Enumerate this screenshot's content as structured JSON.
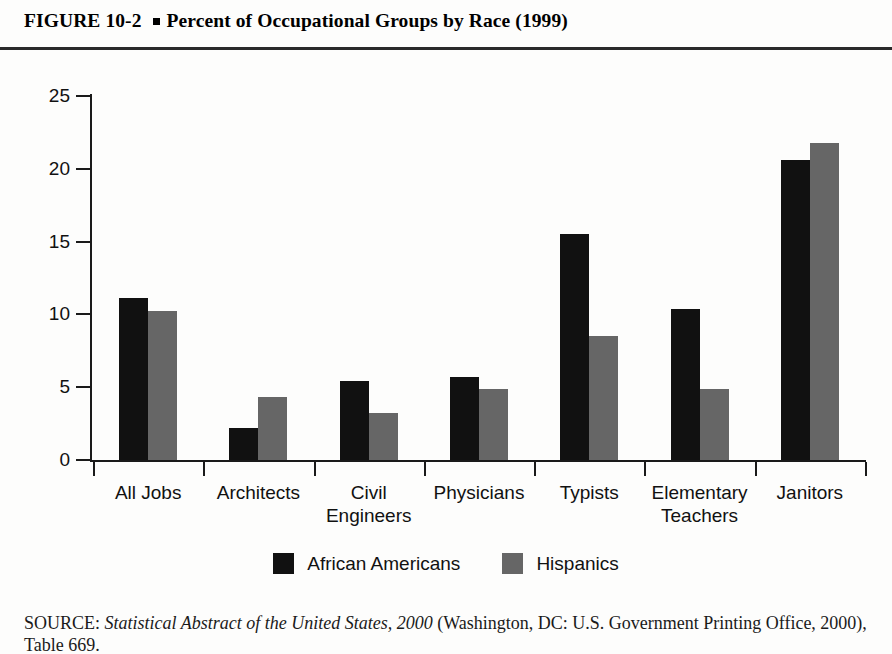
{
  "figure": {
    "number": "FIGURE  10-2",
    "bullet_icon": "square-bullet-icon",
    "title": "Percent of Occupational Groups by Race (1999)"
  },
  "source_note": {
    "prefix": "SOURCE:",
    "italic_part": "Statistical Abstract of the United States, 2000",
    "rest": "(Washington, DC: U.S. Government Printing Office, 2000), Table 669."
  },
  "colors": {
    "african_americans": "#111111",
    "hispanics": "#666666",
    "axis": "#1a1a1a",
    "background": "#fdfdfc"
  },
  "chart_data": {
    "type": "bar",
    "title": "Percent of Occupational Groups by Race (1999)",
    "xlabel": "",
    "ylabel": "",
    "ylim": [
      0,
      25
    ],
    "yticks": [
      0,
      5,
      10,
      15,
      20,
      25
    ],
    "ytick_labels": [
      "0",
      "5",
      "10",
      "15",
      "20",
      "25"
    ],
    "grid": false,
    "legend_position": "bottom-center",
    "categories": [
      "All Jobs",
      "Architects",
      "Civil Engineers",
      "Physicians",
      "Typists",
      "Elementary Teachers",
      "Janitors"
    ],
    "category_lines": [
      [
        "All Jobs"
      ],
      [
        "Architects"
      ],
      [
        "Civil",
        "Engineers"
      ],
      [
        "Physicians"
      ],
      [
        "Typists"
      ],
      [
        "Elementary",
        "Teachers"
      ],
      [
        "Janitors"
      ]
    ],
    "series": [
      {
        "name": "African Americans",
        "color": "#111111",
        "values": [
          11.1,
          2.2,
          5.4,
          5.7,
          15.5,
          10.4,
          20.6
        ]
      },
      {
        "name": "Hispanics",
        "color": "#666666",
        "values": [
          10.2,
          4.3,
          3.2,
          4.9,
          8.5,
          4.9,
          21.8
        ]
      }
    ]
  },
  "legend": {
    "items": [
      {
        "label": "African Americans",
        "swatch": "#111111"
      },
      {
        "label": "Hispanics",
        "swatch": "#666666"
      }
    ]
  }
}
